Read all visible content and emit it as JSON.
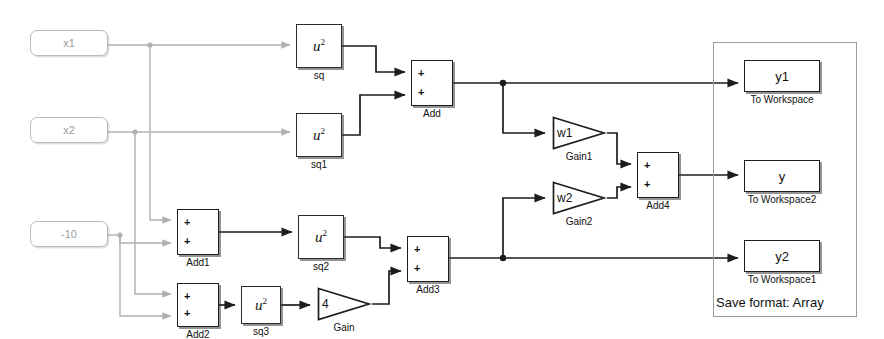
{
  "diagram": {
    "colors": {
      "source_stroke": "#b9b9b9",
      "source_text": "#9a9a9a",
      "block_stroke": "#1d1d1d",
      "wire_light": "#b0b0b0",
      "wire_dark": "#1d1d1d",
      "group_stroke": "#9d9d9d"
    },
    "sources": [
      {
        "id": "x1",
        "value": "x1",
        "x": 30,
        "y": 30,
        "w": 78,
        "h": 26
      },
      {
        "id": "x2",
        "value": "x2",
        "x": 30,
        "y": 117,
        "w": 78,
        "h": 26
      },
      {
        "id": "c10",
        "value": "-10",
        "x": 30,
        "y": 221,
        "w": 78,
        "h": 26
      }
    ],
    "math_blocks": [
      {
        "id": "sq",
        "expr_base": "u",
        "expr_sup": "2",
        "name": "sq",
        "x": 296,
        "y": 24,
        "w": 46,
        "h": 44
      },
      {
        "id": "sq1",
        "expr_base": "u",
        "expr_sup": "2",
        "name": "sq1",
        "x": 296,
        "y": 113,
        "w": 46,
        "h": 44
      },
      {
        "id": "sq2",
        "expr_base": "u",
        "expr_sup": "2",
        "name": "sq2",
        "x": 298,
        "y": 215,
        "w": 46,
        "h": 44
      },
      {
        "id": "sq3",
        "expr_base": "u",
        "expr_sup": "2",
        "name": "sq3",
        "x": 241,
        "y": 286,
        "w": 40,
        "h": 38
      }
    ],
    "sum_blocks": [
      {
        "id": "Add",
        "name": "Add",
        "sign1": "+",
        "sign2": "+",
        "x": 411,
        "y": 60,
        "w": 42,
        "h": 46
      },
      {
        "id": "Add1",
        "name": "Add1",
        "sign1": "+",
        "sign2": "+",
        "x": 177,
        "y": 209,
        "w": 42,
        "h": 46
      },
      {
        "id": "Add2",
        "name": "Add2",
        "sign1": "+",
        "sign2": "+",
        "x": 177,
        "y": 283,
        "w": 42,
        "h": 44
      },
      {
        "id": "Add3",
        "name": "Add3",
        "sign1": "+",
        "sign2": "+",
        "x": 407,
        "y": 236,
        "w": 42,
        "h": 46
      },
      {
        "id": "Add4",
        "name": "Add4",
        "sign1": "+",
        "sign2": "+",
        "x": 637,
        "y": 152,
        "w": 42,
        "h": 46
      }
    ],
    "gain_blocks": [
      {
        "id": "Gain1",
        "value": "w1",
        "name": "Gain1",
        "x": 551,
        "y": 115,
        "w": 56,
        "h": 36
      },
      {
        "id": "Gain2",
        "value": "w2",
        "name": "Gain2",
        "x": 551,
        "y": 180,
        "w": 56,
        "h": 36
      },
      {
        "id": "Gain",
        "value": "4",
        "name": "Gain",
        "x": 316,
        "y": 286,
        "w": 56,
        "h": 36
      }
    ],
    "workspace_blocks": [
      {
        "id": "ToWorkspace",
        "value": "y1",
        "name": "To Workspace",
        "x": 744,
        "y": 60,
        "w": 76,
        "h": 32
      },
      {
        "id": "ToWorkspace2",
        "value": "y",
        "name": "To Workspace2",
        "x": 744,
        "y": 160,
        "w": 76,
        "h": 32
      },
      {
        "id": "ToWorkspace1",
        "value": "y2",
        "name": "To Workspace1",
        "x": 744,
        "y": 240,
        "w": 76,
        "h": 32
      }
    ],
    "group": {
      "x": 713,
      "y": 42,
      "w": 144,
      "h": 275,
      "annotation": "Save format: Array",
      "annotation_x": 716,
      "annotation_y": 296
    }
  }
}
